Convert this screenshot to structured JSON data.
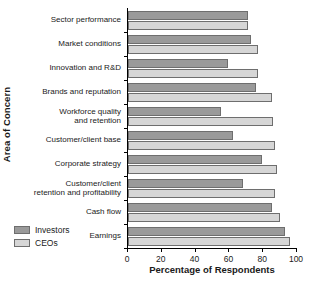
{
  "chart_data": {
    "type": "bar",
    "orientation": "horizontal",
    "title": "",
    "xlabel": "Percentage of Respondents",
    "ylabel": "Area of Concern",
    "xlim": [
      0,
      100
    ],
    "xticks": [
      0,
      20,
      40,
      60,
      80,
      100
    ],
    "grid": false,
    "legend_position": "bottom-left",
    "categories": [
      "Sector performance",
      "Market conditions",
      "Innovation and R&D",
      "Brands and reputation",
      "Workforce quality and retention",
      "Customer/client base",
      "Corporate strategy",
      "Customer/client retention and profitability",
      "Cash flow",
      "Earnings"
    ],
    "category_lines": [
      [
        "Sector performance"
      ],
      [
        "Market conditions"
      ],
      [
        "Innovation and R&D"
      ],
      [
        "Brands and reputation"
      ],
      [
        "Workforce quality",
        "and retention"
      ],
      [
        "Customer/client base"
      ],
      [
        "Corporate strategy"
      ],
      [
        "Customer/client",
        "retention and profitability"
      ],
      [
        "Cash flow"
      ],
      [
        "Earnings"
      ]
    ],
    "series": [
      {
        "name": "Investors",
        "color": "#9a9a9a",
        "values": [
          71,
          73,
          59,
          76,
          55,
          62,
          79,
          68,
          85,
          93
        ]
      },
      {
        "name": "CEOs",
        "color": "#d6d6d6",
        "values": [
          71,
          77,
          77,
          85,
          86,
          87,
          88,
          87,
          90,
          96
        ]
      }
    ]
  },
  "legend": {
    "items": [
      {
        "label": "Investors",
        "swatch": "investors"
      },
      {
        "label": "CEOs",
        "swatch": "ceos"
      }
    ]
  }
}
